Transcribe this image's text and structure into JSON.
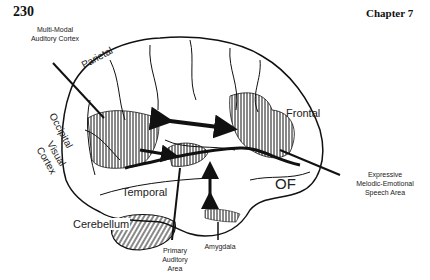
{
  "page": {
    "page_number": "230",
    "chapter": "Chapter 7"
  },
  "figure": {
    "region_labels": {
      "parietal": "Parietal",
      "occipital": "Occipital",
      "visual_cortex_1": "Visual",
      "visual_cortex_2": "Cortex",
      "frontal": "Frontal",
      "temporal": "Temporal",
      "cerebellum": "Cerebellum",
      "orbitofrontal": "OF"
    },
    "callouts": {
      "multimodal_1": "Multi-Modal",
      "multimodal_2": "Auditory Cortex",
      "expressive_1": "Expressive",
      "expressive_2": "Melodic-Emotional",
      "expressive_3": "Speech Area",
      "primary_1": "Primary",
      "primary_2": "Auditory",
      "primary_3": "Area",
      "amygdala": "Amygdala"
    },
    "colors": {
      "ink": "#111111",
      "background": "#ffffff"
    }
  }
}
